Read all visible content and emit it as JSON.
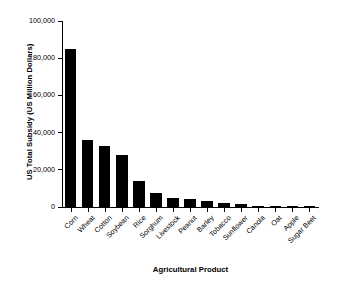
{
  "chart_data": {
    "type": "bar",
    "title": "",
    "xlabel": "Agricultural Product",
    "ylabel": "US Total Subsidy (US Million Dollars)",
    "categories": [
      "Corn",
      "Wheat",
      "Cotton",
      "Soybean",
      "Rice",
      "Sorghum",
      "Livestock",
      "Peanut",
      "Barley",
      "Tobacco",
      "Sunflower",
      "Canola",
      "Oat",
      "Apple",
      "Sugar Beet"
    ],
    "values": [
      85000,
      36000,
      33000,
      28000,
      14000,
      7500,
      5000,
      4500,
      3200,
      2100,
      1700,
      600,
      400,
      300,
      200
    ],
    "ylim": [
      0,
      100000
    ],
    "ytick_values": [
      0,
      20000,
      40000,
      60000,
      80000,
      100000
    ],
    "ytick_labels": [
      "0",
      "20,000",
      "40,000",
      "60,000",
      "80,000",
      "100,000"
    ],
    "grid": false,
    "legend": null,
    "bar_color": "#000000",
    "axis_color": "#000000",
    "background_color": "#ffffff"
  }
}
